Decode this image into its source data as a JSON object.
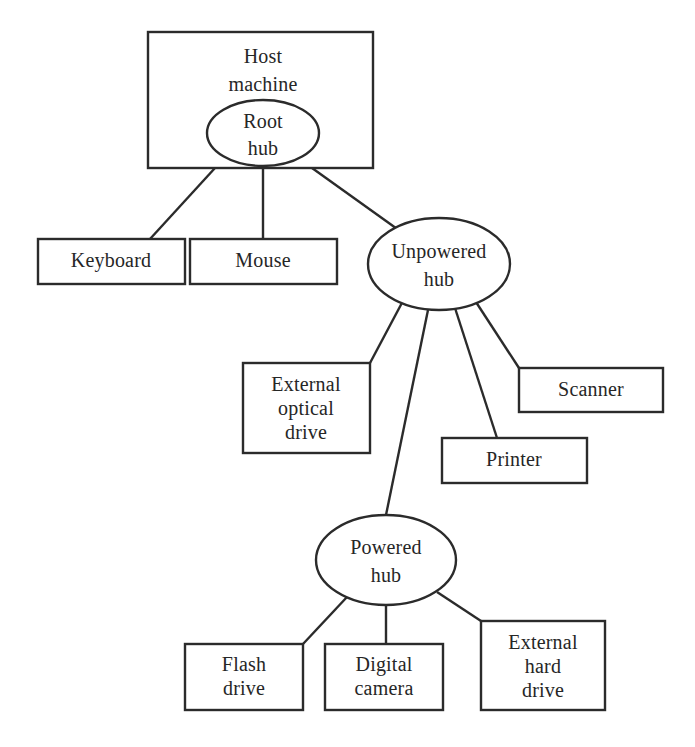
{
  "diagram": {
    "type": "node-link-tree",
    "background_color": "#ffffff",
    "stroke_color": "#2b2b2b",
    "text_color": "#262626",
    "nodes": {
      "host_machine": {
        "shape": "rectangle",
        "label": "Host machine",
        "line1": "Host",
        "line2": "machine"
      },
      "root_hub": {
        "shape": "ellipse",
        "label": "Root hub",
        "line1": "Root",
        "line2": "hub"
      },
      "keyboard": {
        "shape": "rectangle",
        "label": "Keyboard",
        "line1": "Keyboard"
      },
      "mouse": {
        "shape": "rectangle",
        "label": "Mouse",
        "line1": "Mouse"
      },
      "unpowered_hub": {
        "shape": "ellipse",
        "label": "Unpowered hub",
        "line1": "Unpowered",
        "line2": "hub"
      },
      "external_optical_drive": {
        "shape": "rectangle",
        "label": "External optical drive",
        "line1": "External",
        "line2": "optical",
        "line3": "drive"
      },
      "printer": {
        "shape": "rectangle",
        "label": "Printer",
        "line1": "Printer"
      },
      "scanner": {
        "shape": "rectangle",
        "label": "Scanner",
        "line1": "Scanner"
      },
      "powered_hub": {
        "shape": "ellipse",
        "label": "Powered hub",
        "line1": "Powered",
        "line2": "hub"
      },
      "flash_drive": {
        "shape": "rectangle",
        "label": "Flash drive",
        "line1": "Flash",
        "line2": "drive"
      },
      "digital_camera": {
        "shape": "rectangle",
        "label": "Digital camera",
        "line1": "Digital",
        "line2": "camera"
      },
      "external_hard_drive": {
        "shape": "rectangle",
        "label": "External hard drive",
        "line1": "External",
        "line2": "hard",
        "line3": "drive"
      }
    },
    "edges": [
      {
        "from": "host_machine",
        "to": "keyboard"
      },
      {
        "from": "host_machine",
        "to": "mouse"
      },
      {
        "from": "host_machine",
        "to": "unpowered_hub"
      },
      {
        "from": "unpowered_hub",
        "to": "external_optical_drive"
      },
      {
        "from": "unpowered_hub",
        "to": "powered_hub"
      },
      {
        "from": "unpowered_hub",
        "to": "printer"
      },
      {
        "from": "unpowered_hub",
        "to": "scanner"
      },
      {
        "from": "powered_hub",
        "to": "flash_drive"
      },
      {
        "from": "powered_hub",
        "to": "digital_camera"
      },
      {
        "from": "powered_hub",
        "to": "external_hard_drive"
      }
    ]
  }
}
